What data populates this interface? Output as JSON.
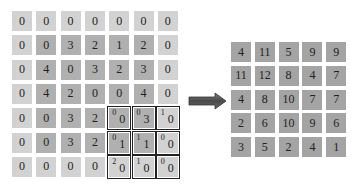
{
  "diagram": {
    "input": {
      "label": "padded input feature map",
      "rows": [
        [
          "0",
          "0",
          "0",
          "0",
          "0",
          "0",
          "0"
        ],
        [
          "0",
          "0",
          "3",
          "2",
          "1",
          "2",
          "0"
        ],
        [
          "0",
          "4",
          "0",
          "3",
          "2",
          "3",
          "0"
        ],
        [
          "0",
          "4",
          "2",
          "0",
          "0",
          "4",
          "0"
        ],
        [
          "0",
          "0",
          "3",
          "2",
          "0",
          "3",
          "0"
        ],
        [
          "0",
          "0",
          "3",
          "2",
          "1",
          "1",
          "0"
        ],
        [
          "0",
          "0",
          "0",
          "0",
          "0",
          "0",
          "0"
        ]
      ]
    },
    "kernel": {
      "label": "3x3 kernel overlay",
      "position": {
        "row": 4,
        "col": 4
      },
      "weights": [
        [
          "0",
          "0",
          "1"
        ],
        [
          "0",
          "1",
          "0"
        ],
        [
          "2",
          "1",
          "0"
        ]
      ]
    },
    "output": {
      "label": "output feature map",
      "rows": [
        [
          "4",
          "11",
          "5",
          "9",
          "9"
        ],
        [
          "11",
          "12",
          "8",
          "4",
          "7"
        ],
        [
          "4",
          "8",
          "10",
          "7",
          "7"
        ],
        [
          "2",
          "6",
          "10",
          "9",
          "6"
        ],
        [
          "3",
          "5",
          "2",
          "4",
          "1"
        ]
      ]
    },
    "arrow": {
      "icon": "right-arrow-icon",
      "color": "#5a5a5a"
    },
    "colors": {
      "padding_cell": "#d2d2d2",
      "inner_cell": "#b0b0b0",
      "output_cell": "#a4a4a4",
      "kernel_border": "#222222"
    }
  }
}
